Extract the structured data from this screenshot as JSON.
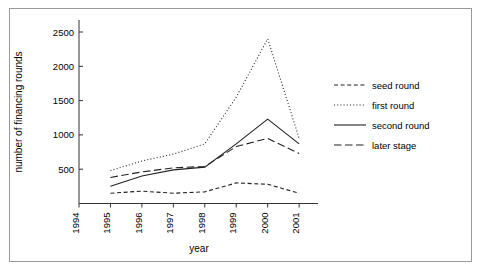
{
  "chart_data": {
    "type": "line",
    "title": "",
    "xlabel": "year",
    "ylabel": "number of financing rounds",
    "x": [
      1995,
      1996,
      1997,
      1998,
      1999,
      2000,
      2001
    ],
    "xtick_labels": [
      "1994",
      "1995",
      "1996",
      "1997",
      "1998",
      "1999",
      "2000",
      "2001"
    ],
    "xlim": [
      1994,
      2001.6
    ],
    "ytick_labels": [
      "500",
      "1000",
      "1500",
      "2000",
      "2500"
    ],
    "yticks": [
      500,
      1000,
      1500,
      2000,
      2500
    ],
    "ylim": [
      0,
      2650
    ],
    "grid": false,
    "legend_position": "right",
    "series": [
      {
        "name": "seed round",
        "style": "dashed",
        "color": "#222222",
        "values": [
          150,
          180,
          150,
          170,
          300,
          280,
          150
        ]
      },
      {
        "name": "first round",
        "style": "dotted",
        "color": "#222222",
        "values": [
          480,
          620,
          720,
          870,
          1550,
          2400,
          950
        ]
      },
      {
        "name": "second round",
        "style": "solid",
        "color": "#222222",
        "values": [
          250,
          400,
          490,
          530,
          870,
          1230,
          870
        ]
      },
      {
        "name": "later stage",
        "style": "longdash",
        "color": "#222222",
        "values": [
          380,
          460,
          520,
          540,
          830,
          950,
          730
        ]
      }
    ]
  },
  "legend": {
    "entries": [
      {
        "label": "seed round"
      },
      {
        "label": "first round"
      },
      {
        "label": "second round"
      },
      {
        "label": "later stage"
      }
    ]
  },
  "axes": {
    "x_title": "year",
    "y_title": "number of financing rounds"
  }
}
